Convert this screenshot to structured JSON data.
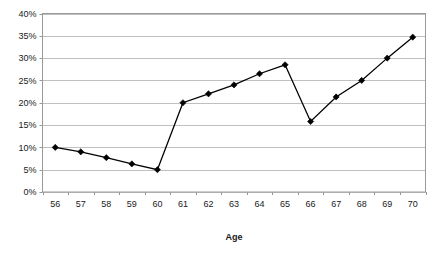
{
  "chart_data": {
    "type": "line",
    "title": "",
    "subtitle": "",
    "xlabel": "Age",
    "ylabel": "",
    "categories": [
      "56",
      "57",
      "58",
      "59",
      "60",
      "61",
      "62",
      "63",
      "64",
      "65",
      "66",
      "67",
      "68",
      "69",
      "70"
    ],
    "x": [
      56,
      57,
      58,
      59,
      60,
      61,
      62,
      63,
      64,
      65,
      66,
      67,
      68,
      69,
      70
    ],
    "values": [
      10.0,
      9.0,
      7.7,
      6.3,
      5.0,
      20.0,
      22.0,
      24.0,
      26.5,
      28.5,
      15.8,
      21.3,
      25.0,
      30.0,
      34.7
    ],
    "series": [
      {
        "name": "",
        "values": [
          10.0,
          9.0,
          7.7,
          6.3,
          5.0,
          20.0,
          22.0,
          24.0,
          26.5,
          28.5,
          15.8,
          21.3,
          25.0,
          30.0,
          34.7
        ]
      }
    ],
    "ylim": [
      0,
      40
    ],
    "ytick_values": [
      0,
      5,
      10,
      15,
      20,
      25,
      30,
      35,
      40
    ],
    "ytick_labels": [
      "0%",
      "5%",
      "10%",
      "15%",
      "20%",
      "25%",
      "30%",
      "35%",
      "40%"
    ],
    "xtick_labels": [
      "56",
      "57",
      "58",
      "59",
      "60",
      "61",
      "62",
      "63",
      "64",
      "65",
      "66",
      "67",
      "68",
      "69",
      "70"
    ],
    "grid": true,
    "grid_axis": "y",
    "legend": false,
    "legend_position": "none",
    "marker": "diamond",
    "line_color": "#000000",
    "marker_color": "#000000",
    "grid_color": "#c0c0c0",
    "frame_color": "#999999",
    "plot_background": "#ffffff",
    "annotations": []
  },
  "axis": {
    "x_title": "Age"
  }
}
